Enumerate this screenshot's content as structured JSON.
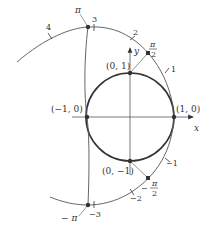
{
  "figure": {
    "axes": {
      "x_label": "x",
      "y_label": "y"
    },
    "unit_circle_points": [
      {
        "label": "(1, 0)"
      },
      {
        "label": "(0, 1)"
      },
      {
        "label": "(−1, 0)"
      },
      {
        "label": "(0, −1)"
      }
    ],
    "wrapped_line_ticks": {
      "positive": [
        "1",
        "2",
        "3",
        "4"
      ],
      "negative": [
        "−1",
        "−2",
        "−3"
      ]
    },
    "special_points": {
      "pi_half": {
        "num": "π",
        "den": "2"
      },
      "neg_pi_half": {
        "sign": "−",
        "num": "π",
        "den": "2"
      },
      "pi": "π",
      "neg_pi": "− π"
    }
  }
}
